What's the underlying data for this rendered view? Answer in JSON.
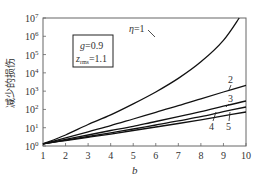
{
  "chart_data": {
    "type": "line",
    "title": "",
    "xlabel": "b",
    "ylabel": "减少的损伤",
    "xlim": [
      1,
      10
    ],
    "ylim": [
      1,
      10000000
    ],
    "yscale": "log",
    "grid": false,
    "x_ticks": [
      "1",
      "2",
      "3",
      "4",
      "5",
      "6",
      "7",
      "8",
      "9",
      "10"
    ],
    "y_ticks": [
      "10^0",
      "10^1",
      "10^2",
      "10^3",
      "10^4",
      "10^5",
      "10^6",
      "10^7"
    ],
    "annotation_box": {
      "line1": "g=0.9",
      "line2_main": "z",
      "line2_sub": "rms",
      "line2_value": "=1.1"
    },
    "series": [
      {
        "name": "η=1",
        "label": "η=1",
        "x": [
          1,
          2,
          3,
          4,
          5,
          6,
          7,
          8,
          9,
          9.7
        ],
        "y": [
          1.3,
          4,
          15,
          50,
          200,
          900,
          5000,
          40000,
          600000,
          10000000
        ]
      },
      {
        "name": "2",
        "label": "2",
        "x": [
          1,
          2,
          3,
          4,
          5,
          6,
          7,
          8,
          9,
          10
        ],
        "y": [
          1.3,
          2.8,
          6,
          13,
          30,
          70,
          160,
          380,
          900,
          2100
        ]
      },
      {
        "name": "3",
        "label": "3",
        "x": [
          1,
          2,
          3,
          4,
          5,
          6,
          7,
          8,
          9,
          10
        ],
        "y": [
          1.3,
          2.3,
          4,
          7,
          12,
          22,
          40,
          75,
          150,
          290
        ]
      },
      {
        "name": "4",
        "label": "4",
        "x": [
          1,
          2,
          3,
          4,
          5,
          6,
          7,
          8,
          9,
          10
        ],
        "y": [
          1.3,
          2.1,
          3.3,
          5.3,
          8.5,
          14,
          24,
          40,
          75,
          135
        ]
      },
      {
        "name": "5",
        "label": "5",
        "x": [
          1,
          2,
          3,
          4,
          5,
          6,
          7,
          8,
          9,
          10
        ],
        "y": [
          1.3,
          2.0,
          3.0,
          4.5,
          7,
          11,
          17,
          27,
          45,
          72
        ]
      }
    ]
  },
  "labels": {
    "eta1": "η=1",
    "s2": "2",
    "s3": "3",
    "s4": "4",
    "s5": "5",
    "xlabel": "b",
    "ylabel": "减少的损伤",
    "box_g": "g=0.9",
    "box_z": "z",
    "box_sub": "rms",
    "box_val": "=1.1"
  }
}
